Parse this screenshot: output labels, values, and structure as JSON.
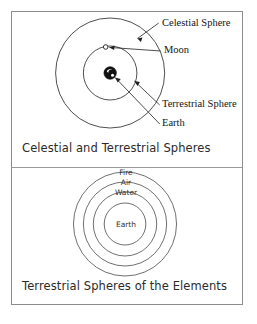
{
  "figure": {
    "background_color": "#ffffff",
    "frame_color": "#8d8d8d",
    "line_color": "#333333",
    "text_color": "#141414"
  },
  "panels": [
    {
      "id": "celestial",
      "caption": "Celestial and Terrestrial Spheres",
      "callouts": [
        {
          "label": "Celestial Sphere",
          "target": "outer-circle"
        },
        {
          "label": "Moon",
          "target": "moon-marker"
        },
        {
          "label": "Terrestrial Sphere",
          "target": "inner-circle"
        },
        {
          "label": "Earth",
          "target": "earth-marker"
        }
      ],
      "bodies": [
        {
          "name": "Earth",
          "style": "filled-globe"
        },
        {
          "name": "Moon",
          "style": "small-open-circle"
        }
      ],
      "spheres": [
        {
          "name": "Celestial Sphere",
          "radius": 55
        },
        {
          "name": "Terrestrial Sphere",
          "radius": 27
        }
      ]
    },
    {
      "id": "elements",
      "caption": "Terrestrial Spheres of the Elements",
      "rings": [
        {
          "label": "Fire",
          "radius": 52
        },
        {
          "label": "Air",
          "radius": 42
        },
        {
          "label": "Water",
          "radius": 32
        },
        {
          "label": "Earth",
          "radius": 21
        }
      ]
    }
  ],
  "bottom_note": ""
}
